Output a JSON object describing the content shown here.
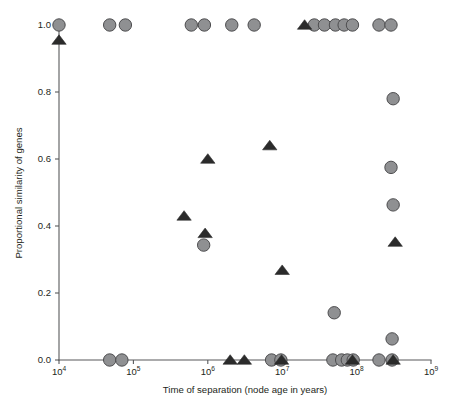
{
  "chart_data": {
    "type": "scatter",
    "title": "",
    "xlabel": "Time of separation (node age in years)",
    "ylabel": "Proportional similarity of genes",
    "xscale": "log",
    "xlim": [
      10000,
      1000000000
    ],
    "ylim": [
      0.0,
      1.0
    ],
    "grid": false,
    "legend": "none",
    "xticks": [
      {
        "value": 10000,
        "label": "10",
        "exponent": "4"
      },
      {
        "value": 100000,
        "label": "10",
        "exponent": "5"
      },
      {
        "value": 1000000,
        "label": "10",
        "exponent": "6"
      },
      {
        "value": 10000000,
        "label": "10",
        "exponent": "7"
      },
      {
        "value": 100000000,
        "label": "10",
        "exponent": "8"
      },
      {
        "value": 1000000000,
        "label": "10",
        "exponent": "9"
      }
    ],
    "yticks": [
      {
        "value": 0.0,
        "label": "0.0"
      },
      {
        "value": 0.2,
        "label": "0.2"
      },
      {
        "value": 0.4,
        "label": "0.4"
      },
      {
        "value": 0.6,
        "label": "0.6"
      },
      {
        "value": 0.8,
        "label": "0.8"
      },
      {
        "value": 1.0,
        "label": "1.0"
      }
    ],
    "series": [
      {
        "name": "circles",
        "marker": "circle",
        "color": "#8f9092",
        "edge_color": "#4d4d4f",
        "points": [
          {
            "x": 10000,
            "y": 1.0
          },
          {
            "x": 48000,
            "y": 1.0
          },
          {
            "x": 78000,
            "y": 1.0
          },
          {
            "x": 600000,
            "y": 1.0
          },
          {
            "x": 900000,
            "y": 1.0
          },
          {
            "x": 2100000,
            "y": 1.0
          },
          {
            "x": 4200000,
            "y": 1.0
          },
          {
            "x": 27000000,
            "y": 1.0
          },
          {
            "x": 37000000,
            "y": 1.0
          },
          {
            "x": 52000000,
            "y": 1.0
          },
          {
            "x": 68000000,
            "y": 1.0
          },
          {
            "x": 88000000,
            "y": 1.0
          },
          {
            "x": 200000000,
            "y": 1.0
          },
          {
            "x": 290000000,
            "y": 1.0
          },
          {
            "x": 310000000,
            "y": 0.78
          },
          {
            "x": 290000000,
            "y": 0.575
          },
          {
            "x": 310000000,
            "y": 0.463
          },
          {
            "x": 880000,
            "y": 0.343
          },
          {
            "x": 50000000,
            "y": 0.141
          },
          {
            "x": 300000000,
            "y": 0.063
          },
          {
            "x": 48000000,
            "y": 0.0
          },
          {
            "x": 63000000,
            "y": 0.0
          },
          {
            "x": 7200000,
            "y": 0.0
          },
          {
            "x": 9600000,
            "y": 0.0
          },
          {
            "x": 75000000,
            "y": 0.0
          },
          {
            "x": 90000000,
            "y": 0.0
          },
          {
            "x": 200000000,
            "y": 0.0
          },
          {
            "x": 300000000,
            "y": 0.0
          },
          {
            "x": 48000,
            "y": 0.0
          },
          {
            "x": 70000,
            "y": 0.0
          }
        ]
      },
      {
        "name": "triangles",
        "marker": "triangle",
        "color": "#2b2b2b",
        "points": [
          {
            "x": 10000,
            "y": 0.955
          },
          {
            "x": 20000000,
            "y": 1.0
          },
          {
            "x": 6800000,
            "y": 0.64
          },
          {
            "x": 1000000,
            "y": 0.6
          },
          {
            "x": 480000,
            "y": 0.43
          },
          {
            "x": 920000,
            "y": 0.378
          },
          {
            "x": 330000000,
            "y": 0.352
          },
          {
            "x": 10000000,
            "y": 0.268
          },
          {
            "x": 2000000,
            "y": 0.0
          },
          {
            "x": 3100000,
            "y": 0.0
          },
          {
            "x": 9800000,
            "y": 0.0
          },
          {
            "x": 88000000,
            "y": 0.0
          },
          {
            "x": 310000000,
            "y": 0.0
          }
        ]
      }
    ]
  },
  "figure": {
    "background": "#ffffff",
    "axis_color": "#58595b",
    "text_color": "#231f20"
  }
}
